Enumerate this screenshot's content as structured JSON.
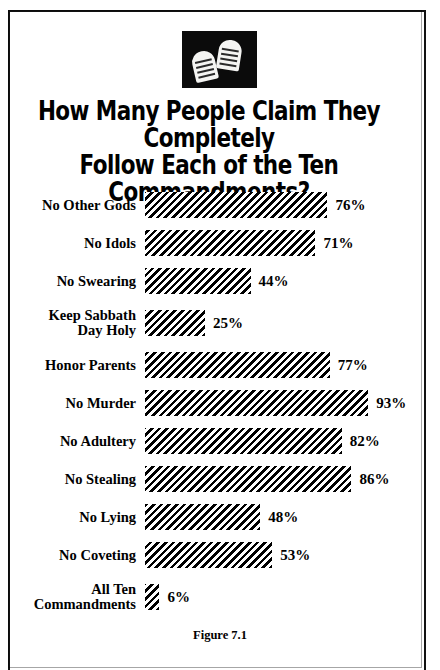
{
  "figure": {
    "title": "How Many People Claim They Completely\nFollow Each of the Ten Commandments?",
    "caption": "Figure 7.1",
    "icon_name": "stone-tablets-icon"
  },
  "chart_data": {
    "type": "bar",
    "orientation": "horizontal",
    "title": "How Many People Claim They Completely Follow Each of the Ten Commandments?",
    "xlabel": "",
    "ylabel": "",
    "xlim": [
      0,
      100
    ],
    "grid": false,
    "legend": "none",
    "value_suffix": "%",
    "categories": [
      "No Other Gods",
      "No Idols",
      "No Swearing",
      "Keep Sabbath\nDay Holy",
      "Honor Parents",
      "No Murder",
      "No Adultery",
      "No Stealing",
      "No Lying",
      "No Coveting",
      "All Ten\nCommandments"
    ],
    "values": [
      76,
      71,
      44,
      25,
      77,
      93,
      82,
      86,
      48,
      53,
      6
    ],
    "value_labels": [
      "76%",
      "71%",
      "44%",
      "25%",
      "77%",
      "93%",
      "82%",
      "86%",
      "48%",
      "53%",
      "6%"
    ],
    "bars": [
      {
        "label": "No Other Gods",
        "value": 76,
        "value_label": "76%",
        "tall": false
      },
      {
        "label": "No Idols",
        "value": 71,
        "value_label": "71%",
        "tall": false
      },
      {
        "label": "No Swearing",
        "value": 44,
        "value_label": "44%",
        "tall": false
      },
      {
        "label": "Keep Sabbath\nDay Holy",
        "value": 25,
        "value_label": "25%",
        "tall": true
      },
      {
        "label": "Honor Parents",
        "value": 77,
        "value_label": "77%",
        "tall": false
      },
      {
        "label": "No Murder",
        "value": 93,
        "value_label": "93%",
        "tall": false
      },
      {
        "label": "No Adultery",
        "value": 82,
        "value_label": "82%",
        "tall": false
      },
      {
        "label": "No Stealing",
        "value": 86,
        "value_label": "86%",
        "tall": false
      },
      {
        "label": "No Lying",
        "value": 48,
        "value_label": "48%",
        "tall": false
      },
      {
        "label": "No Coveting",
        "value": 53,
        "value_label": "53%",
        "tall": false
      },
      {
        "label": "All Ten\nCommandments",
        "value": 6,
        "value_label": "6%",
        "tall": true
      }
    ],
    "colors": {
      "background": "#ffffff",
      "ink": "#000000",
      "bar_fill": "#000000",
      "bar_gap": "#ffffff",
      "frame": "#111111"
    },
    "scale": {
      "pixels_per_percent": 2.4,
      "bar_origin_x": 145
    }
  }
}
